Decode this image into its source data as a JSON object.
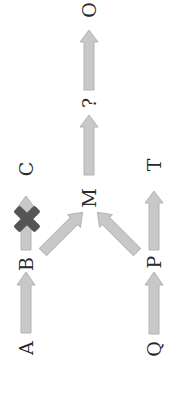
{
  "diagram": {
    "orientation": "rotated-90-ccw",
    "colors": {
      "background": "#ffffff",
      "arrow_fill": "#c8c8c8",
      "arrow_stroke": "#b4b4b4",
      "blocked_mark": "#555555",
      "label_text": "#2a2a2a"
    },
    "nodes": [
      {
        "id": "A",
        "label": "A"
      },
      {
        "id": "B",
        "label": "B"
      },
      {
        "id": "C",
        "label": "C"
      },
      {
        "id": "M",
        "label": "M"
      },
      {
        "id": "unknown",
        "label": "?"
      },
      {
        "id": "O",
        "label": "O"
      },
      {
        "id": "Q",
        "label": "Q"
      },
      {
        "id": "P",
        "label": "P"
      },
      {
        "id": "T",
        "label": "T"
      }
    ],
    "edges": [
      {
        "from": "A",
        "to": "B",
        "blocked": false
      },
      {
        "from": "B",
        "to": "C",
        "blocked": true
      },
      {
        "from": "B",
        "to": "M",
        "blocked": false
      },
      {
        "from": "Q",
        "to": "P",
        "blocked": false
      },
      {
        "from": "P",
        "to": "T",
        "blocked": false
      },
      {
        "from": "P",
        "to": "M",
        "blocked": false
      },
      {
        "from": "M",
        "to": "?",
        "blocked": false
      },
      {
        "from": "?",
        "to": "O",
        "blocked": false
      }
    ],
    "blocked_mark_icon": "x-cross-icon"
  }
}
